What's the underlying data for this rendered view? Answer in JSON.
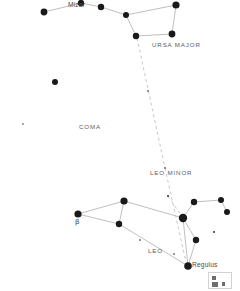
{
  "chart": {
    "type": "star-chart",
    "width": 240,
    "height": 291,
    "background_color": "#ffffff",
    "star_color": "#1a1a1a",
    "line_color": "#b8b8ba",
    "dashed_line_color": "#c0c0c2",
    "label_color": "#58585a"
  },
  "labels": {
    "mizar": {
      "text": "Mizar",
      "x": 68,
      "y": 2,
      "kind": "star"
    },
    "ursa_major": {
      "text": "URSA  MAJOR",
      "x": 152,
      "y": 42,
      "kind": "constellation"
    },
    "coma": {
      "text": "COMA",
      "x": 79,
      "y": 124,
      "kind": "constellation"
    },
    "leo_minor": {
      "text": "LEO  MINOR",
      "x": 150,
      "y": 170,
      "kind": "constellation"
    },
    "leo": {
      "text": "LEO",
      "x": 148,
      "y": 248,
      "kind": "constellation"
    },
    "regulus": {
      "text": "Regulus",
      "x": 192,
      "y": 262,
      "kind": "star"
    },
    "beta": {
      "text": "β",
      "x": 75,
      "y": 219,
      "kind": "greek"
    }
  },
  "stars": [
    {
      "name": "alkaid",
      "x": 44,
      "y": 12,
      "r": 3.4
    },
    {
      "name": "mizar",
      "x": 81,
      "y": 3,
      "r": 3.2
    },
    {
      "name": "alioth",
      "x": 101,
      "y": 7,
      "r": 3.2
    },
    {
      "name": "megrez",
      "x": 126,
      "y": 15,
      "r": 3.0
    },
    {
      "name": "dubhe",
      "x": 176,
      "y": 5,
      "r": 3.6
    },
    {
      "name": "merak",
      "x": 172,
      "y": 34,
      "r": 3.4
    },
    {
      "name": "phecda",
      "x": 136,
      "y": 36,
      "r": 3.2
    },
    {
      "name": "coma-star",
      "x": 55,
      "y": 82,
      "r": 3.0
    },
    {
      "name": "coma-faint",
      "x": 23,
      "y": 124,
      "r": 0.7
    },
    {
      "name": "pointer-mid",
      "x": 148,
      "y": 91,
      "r": 0.8
    },
    {
      "name": "pointer-low",
      "x": 165,
      "y": 168,
      "r": 0.8
    },
    {
      "name": "denebola",
      "x": 78,
      "y": 214,
      "r": 3.6
    },
    {
      "name": "leo-upper",
      "x": 124,
      "y": 201,
      "r": 3.6
    },
    {
      "name": "zosma",
      "x": 119,
      "y": 224,
      "r": 3.2
    },
    {
      "name": "algieba",
      "x": 183,
      "y": 218,
      "r": 4.2
    },
    {
      "name": "adhafera",
      "x": 194,
      "y": 202,
      "r": 3.2
    },
    {
      "name": "leo-minor-a",
      "x": 221,
      "y": 200,
      "r": 3.0
    },
    {
      "name": "leo-minor-b",
      "x": 227,
      "y": 212,
      "r": 3.0
    },
    {
      "name": "rho-leonis",
      "x": 196,
      "y": 240,
      "r": 3.2
    },
    {
      "name": "regulus",
      "x": 188,
      "y": 266,
      "r": 3.8
    },
    {
      "name": "leo-faint-1",
      "x": 140,
      "y": 240,
      "r": 0.8
    },
    {
      "name": "leo-faint-2",
      "x": 174,
      "y": 254,
      "r": 0.8
    },
    {
      "name": "leo-faint-3",
      "x": 214,
      "y": 232,
      "r": 0.9
    },
    {
      "name": "leo-faint-4",
      "x": 168,
      "y": 196,
      "r": 0.9
    }
  ],
  "lines": [
    {
      "name": "alkaid-mizar",
      "x1": 44,
      "y1": 12,
      "x2": 81,
      "y2": 3
    },
    {
      "name": "mizar-alioth",
      "x1": 81,
      "y1": 3,
      "x2": 101,
      "y2": 7
    },
    {
      "name": "alioth-megrez",
      "x1": 101,
      "y1": 7,
      "x2": 126,
      "y2": 15
    },
    {
      "name": "megrez-dubhe",
      "x1": 126,
      "y1": 15,
      "x2": 176,
      "y2": 5
    },
    {
      "name": "dubhe-merak",
      "x1": 176,
      "y1": 5,
      "x2": 172,
      "y2": 34
    },
    {
      "name": "merak-phecda",
      "x1": 172,
      "y1": 34,
      "x2": 136,
      "y2": 36
    },
    {
      "name": "phecda-megrez",
      "x1": 136,
      "y1": 36,
      "x2": 126,
      "y2": 15
    },
    {
      "name": "denebola-upper",
      "x1": 78,
      "y1": 214,
      "x2": 124,
      "y2": 201
    },
    {
      "name": "denebola-zosma",
      "x1": 78,
      "y1": 214,
      "x2": 119,
      "y2": 224
    },
    {
      "name": "zosma-upper",
      "x1": 119,
      "y1": 224,
      "x2": 124,
      "y2": 201
    },
    {
      "name": "upper-algieba",
      "x1": 124,
      "y1": 201,
      "x2": 183,
      "y2": 218
    },
    {
      "name": "zosma-regulus",
      "x1": 119,
      "y1": 224,
      "x2": 188,
      "y2": 266
    },
    {
      "name": "algieba-adhafera",
      "x1": 183,
      "y1": 218,
      "x2": 194,
      "y2": 202
    },
    {
      "name": "adhafera-lma",
      "x1": 194,
      "y1": 202,
      "x2": 221,
      "y2": 200
    },
    {
      "name": "lma-lmb",
      "x1": 221,
      "y1": 200,
      "x2": 227,
      "y2": 212
    },
    {
      "name": "algieba-rho",
      "x1": 183,
      "y1": 218,
      "x2": 196,
      "y2": 240
    },
    {
      "name": "rho-regulus",
      "x1": 196,
      "y1": 240,
      "x2": 188,
      "y2": 266
    },
    {
      "name": "algieba-regulus",
      "x1": 183,
      "y1": 218,
      "x2": 188,
      "y2": 266
    }
  ],
  "dashed_lines": [
    {
      "name": "pointer-line",
      "x1": 137,
      "y1": 38,
      "x2": 165,
      "y2": 168
    },
    {
      "name": "pointer-line-lower",
      "x1": 165,
      "y1": 168,
      "x2": 186,
      "y2": 262
    },
    {
      "name": "leo-faint-link",
      "x1": 168,
      "y1": 196,
      "x2": 183,
      "y2": 218
    }
  ],
  "corner_box": {
    "name": "corner-legend-box",
    "x": 208,
    "y": 272,
    "width": 24,
    "height": 17
  }
}
